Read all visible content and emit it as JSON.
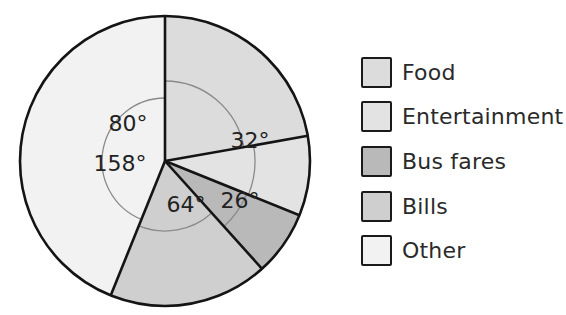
{
  "chart_data": {
    "type": "pie",
    "title": "",
    "unit": "degrees",
    "categories": [
      "Food",
      "Entertainment",
      "Bus fares",
      "Bills",
      "Other"
    ],
    "values": [
      80,
      32,
      26,
      64,
      158
    ],
    "labels": [
      "80°",
      "32°",
      "26°",
      "64°",
      "158°"
    ],
    "total": 360,
    "start_angle": 0,
    "direction": "clockwise",
    "colors": [
      "#dcdcdc",
      "#e3e3e3",
      "#b9b9b9",
      "#cfcfcf",
      "#f2f2f2"
    ],
    "legend_position": "right",
    "grid": false
  },
  "legend": {
    "items": [
      {
        "label": "Food",
        "color": "#dcdcdc"
      },
      {
        "label": "Entertainment",
        "color": "#e3e3e3"
      },
      {
        "label": "Bus fares",
        "color": "#b9b9b9"
      },
      {
        "label": "Bills",
        "color": "#cfcfcf"
      },
      {
        "label": "Other",
        "color": "#f2f2f2"
      }
    ]
  }
}
